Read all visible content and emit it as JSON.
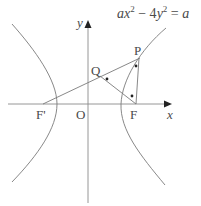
{
  "figure": {
    "equation": {
      "a1": "a",
      "x": "x",
      "exp1": "2",
      "minus": " − 4",
      "y": "y",
      "exp2": "2",
      "equals": " = ",
      "a2": "a",
      "full": "ax² − 4y² = a"
    },
    "labels": {
      "y_axis": "y",
      "x_axis": "x",
      "origin": "O",
      "focus_right": "F",
      "focus_left": "F'",
      "point_p": "P",
      "point_q": "Q"
    },
    "colors": {
      "stroke": "#7a7a7a",
      "axis": "#8a8a8a",
      "text": "#4a4a4a",
      "dot": "#222222"
    },
    "geometry": {
      "origin_px": [
        88,
        104
      ],
      "focus_right_px": [
        136,
        104
      ],
      "focus_left_px": [
        43,
        104
      ],
      "p_px": [
        139,
        58
      ],
      "q_px": [
        100,
        76
      ],
      "angle_markers": 3
    }
  }
}
